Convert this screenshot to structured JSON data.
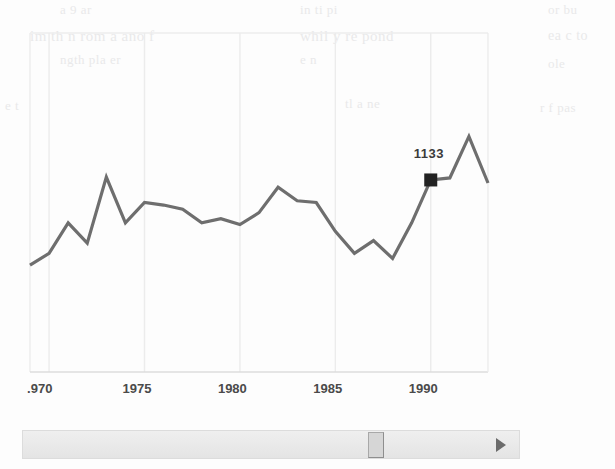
{
  "widget": {
    "type": "scanned-line-chart",
    "background_color": "#fdfdfd",
    "line_color": "#6e6e6e",
    "frame_color": "#ececec",
    "marker_color": "#222222"
  },
  "scrollbar": {
    "orientation": "horizontal",
    "track_color": "#e9e9e9",
    "thumb_color": "#d6d6d6",
    "right_arrow_icon": "triangle-right-icon",
    "thumb_position_percent": 76
  },
  "ghost_text": {
    "note": "faint bleed-through text from the scanned page behind the chart",
    "lines": [
      "a 9 ar",
      "in ti pi",
      "or bu",
      "im th n rom a ano f",
      "whil y re pond",
      "ea c to",
      "ngth pla er",
      "e n",
      "ole",
      "e t",
      "tl a ne",
      "r f pas"
    ]
  },
  "chart_data": {
    "type": "line",
    "title": "",
    "xlabel": "",
    "ylabel": "",
    "grid": true,
    "gridlines_x": [
      1970,
      1975,
      1980,
      1985,
      1990
    ],
    "legend": "none",
    "xlim": [
      1969,
      1993
    ],
    "ylim": [
      0,
      2000
    ],
    "xtick_labels": [
      ".970",
      "1975",
      "1980",
      "1985",
      "1990"
    ],
    "xticks": [
      1970,
      1975,
      1980,
      1985,
      1990
    ],
    "annotations": [
      {
        "label": "1133",
        "x": 1990,
        "y": 1133,
        "marker": "filled-square"
      }
    ],
    "x": [
      1969,
      1970,
      1971,
      1972,
      1973,
      1974,
      1975,
      1976,
      1977,
      1978,
      1979,
      1980,
      1981,
      1982,
      1983,
      1984,
      1985,
      1986,
      1987,
      1988,
      1989,
      1990,
      1991,
      1992,
      1993
    ],
    "values": [
      630,
      700,
      880,
      760,
      1150,
      880,
      1000,
      985,
      960,
      880,
      905,
      870,
      940,
      1090,
      1010,
      1000,
      830,
      700,
      775,
      670,
      880,
      1133,
      1145,
      1390,
      1115
    ],
    "series": [
      {
        "name": "series-1",
        "values": [
          630,
          700,
          880,
          760,
          1150,
          880,
          1000,
          985,
          960,
          880,
          905,
          870,
          940,
          1090,
          1010,
          1000,
          830,
          700,
          775,
          670,
          880,
          1133,
          1145,
          1390,
          1115
        ]
      }
    ]
  }
}
